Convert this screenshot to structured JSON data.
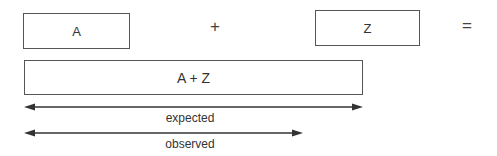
{
  "equation": {
    "term_a": "A",
    "operator_plus": "+",
    "term_z": "Z",
    "operator_equals": "=",
    "sum": "A + Z"
  },
  "arrows": [
    {
      "label": "expected",
      "x1": 24,
      "x2": 363,
      "y": 107
    },
    {
      "label": "observed",
      "x1": 24,
      "x2": 303,
      "y": 133
    }
  ],
  "colors": {
    "stroke": "#555555",
    "arrow": "#333333",
    "text": "#333333"
  }
}
